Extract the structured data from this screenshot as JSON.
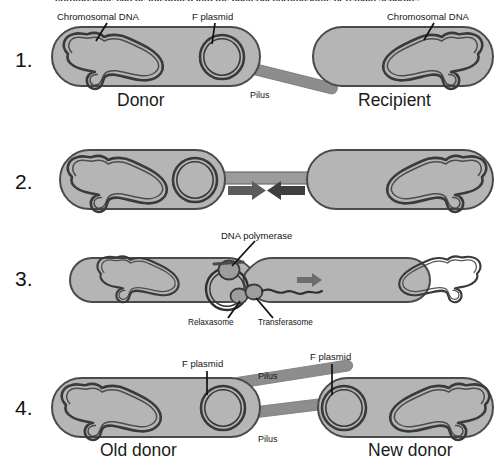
{
  "figure": {
    "title_cut_off": "chromosome can be integrated into the bacterial chromosome or remain separate.",
    "colors": {
      "cell_fill": "#b5b5b5",
      "cell_stroke": "#4a4a4a",
      "dna_stroke": "#3a3a3a",
      "pilus_fill": "#8d8d8d",
      "pilus_stroke": "#6e6e6e",
      "arrow_fill": "#5c5c5c",
      "organelle_fill": "#9a9a9a",
      "text": "#141414",
      "background": "#ffffff"
    }
  },
  "steps": [
    {
      "number": "1.",
      "annotations": [
        {
          "name": "chromosomal-dna-donor",
          "text": "Chromosomal DNA"
        },
        {
          "name": "f-plasmid-donor",
          "text": "F plasmid"
        },
        {
          "name": "pilus",
          "text": "Pilus"
        },
        {
          "name": "chromosomal-dna-recipient",
          "text": "Chromosomal DNA"
        }
      ],
      "cells": [
        {
          "name": "donor-cell",
          "label": "Donor"
        },
        {
          "name": "recipient-cell",
          "label": "Recipient"
        }
      ]
    },
    {
      "number": "2.",
      "annotations": [],
      "cells": [
        {
          "name": "donor-cell",
          "label": ""
        },
        {
          "name": "recipient-cell",
          "label": ""
        }
      ]
    },
    {
      "number": "3.",
      "annotations": [
        {
          "name": "dna-polymerase",
          "text": "DNA polymerase"
        },
        {
          "name": "relaxasome",
          "text": "Relaxasome"
        },
        {
          "name": "transferasome",
          "text": "Transferasome"
        }
      ],
      "cells": [
        {
          "name": "donor-cell",
          "label": ""
        },
        {
          "name": "recipient-cell",
          "label": ""
        }
      ]
    },
    {
      "number": "4.",
      "annotations": [
        {
          "name": "f-plasmid-old-donor",
          "text": "F plasmid"
        },
        {
          "name": "pilus-upper",
          "text": "Pilus"
        },
        {
          "name": "pilus-lower",
          "text": "Pilus"
        },
        {
          "name": "f-plasmid-new-donor",
          "text": "F plasmid"
        }
      ],
      "cells": [
        {
          "name": "old-donor-cell",
          "label": "Old donor"
        },
        {
          "name": "new-donor-cell",
          "label": "New donor"
        }
      ]
    }
  ]
}
